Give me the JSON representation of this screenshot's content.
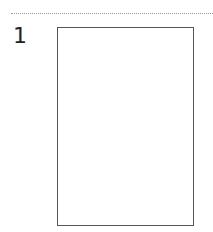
{
  "item": {
    "number": "1"
  },
  "colors": {
    "divider": "#9a9a9a",
    "box_border": "#555555"
  }
}
